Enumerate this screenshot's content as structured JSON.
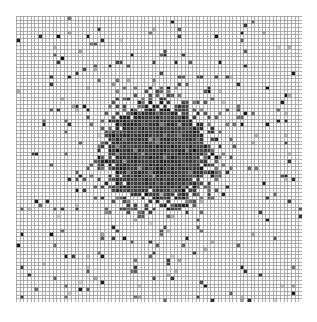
{
  "figure": {
    "width": 317,
    "height": 322,
    "background_color": "#ffffff",
    "margin_left": 16,
    "margin_top": 16,
    "title": "",
    "xlabel": "",
    "ylabel": ""
  },
  "plot": {
    "name": "density-heatmap",
    "left": 16,
    "top": 16,
    "width": 286,
    "height": 286,
    "grid_visible": true,
    "grid_color": "#9a9a9a",
    "grid_line_width": 1,
    "axis_visible": false,
    "tick_labels_visible": false
  },
  "chart_data": {
    "type": "heatmap",
    "title": "",
    "xlabel": "",
    "ylabel": "",
    "grid": true,
    "legend": "none",
    "colormap": "greys",
    "color_low": "#ffffff",
    "color_high": "#111111",
    "grid_line_color": "#9a9a9a",
    "n_cols": 78,
    "n_rows": 78,
    "cell_size_px": 3.667,
    "xlim": [
      0,
      78
    ],
    "ylim": [
      0,
      78
    ],
    "value_range": [
      0,
      1
    ],
    "cluster": {
      "center_col": 38,
      "center_row": 37,
      "core_radius_cells": 12,
      "halo_radius_cells": 22,
      "core_intensity": 0.87,
      "edge_roughness": 0.35
    },
    "scatter": {
      "outlier_density": 0.018,
      "outlier_intensity_min": 0.55,
      "outlier_intensity_max": 1.0,
      "falloff_scale_cells": 30
    },
    "noise": {
      "background_intensity": 0.0,
      "speckle_probability": 0.012,
      "core_speckle_light": 0.1
    },
    "seed": 20240917
  }
}
